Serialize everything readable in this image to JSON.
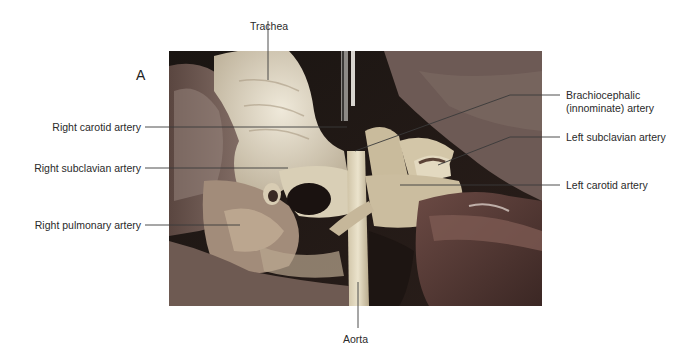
{
  "figure": {
    "panel_letter": "A",
    "photo_description": "Dissection photograph of the aortic arch and its branches"
  },
  "labels": {
    "trachea": "Trachea",
    "right_carotid": "Right carotid artery",
    "right_subclavian": "Right subclavian artery",
    "right_pulmonary": "Right pulmonary artery",
    "brachiocephalic_line1": "Brachiocephalic",
    "brachiocephalic_line2": "(innominate) artery",
    "left_subclavian": "Left subclavian artery",
    "left_carotid": "Left carotid artery",
    "aorta": "Aorta"
  },
  "colors": {
    "background": "#ffffff",
    "leader_line": "#3a3a3a",
    "text": "#2a2a2a"
  }
}
